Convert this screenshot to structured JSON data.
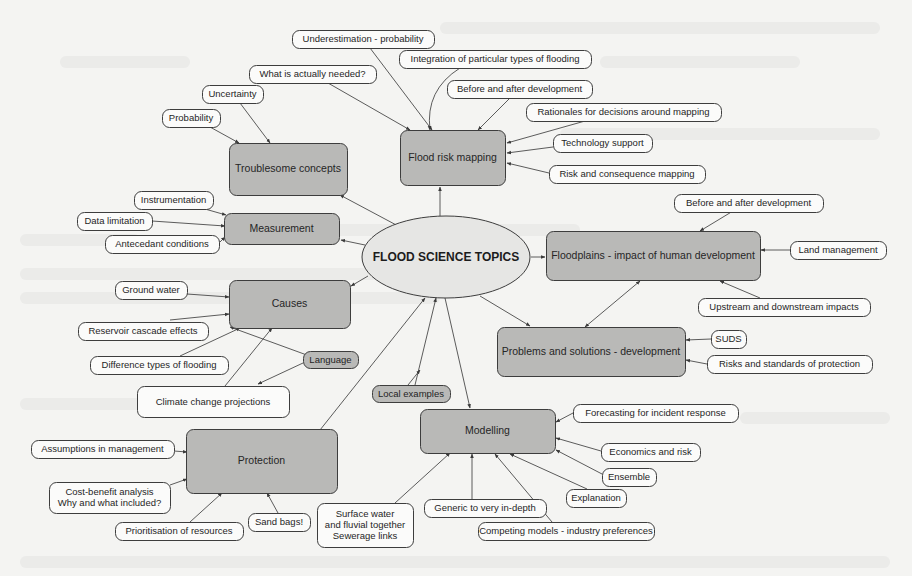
{
  "diagram": {
    "title": "FLOOD SCIENCE TOPICS",
    "colors": {
      "background": "#f4f4f2",
      "main_node_fill": "#b9b9b7",
      "leaf_node_fill": "#fbfbfa",
      "center_fill": "#e6e6e4",
      "stroke": "#3d3d3d"
    },
    "center": {
      "id": "center",
      "label": "FLOOD SCIENCE TOPICS",
      "cx": 446,
      "cy": 257,
      "rx": 84,
      "ry": 41
    },
    "main_nodes": [
      {
        "id": "troublesome",
        "label": "Troublesome concepts",
        "x": 229,
        "y": 143,
        "w": 118,
        "h": 52
      },
      {
        "id": "measurement",
        "label": "Measurement",
        "x": 224,
        "y": 213,
        "w": 115,
        "h": 31
      },
      {
        "id": "causes",
        "label": "Causes",
        "x": 229,
        "y": 280,
        "w": 121,
        "h": 48
      },
      {
        "id": "protection",
        "label": "Protection",
        "x": 186,
        "y": 429,
        "w": 151,
        "h": 64
      },
      {
        "id": "modelling",
        "label": "Modelling",
        "x": 420,
        "y": 409,
        "w": 135,
        "h": 44
      },
      {
        "id": "problems",
        "label": "Problems and solutions - development",
        "x": 497,
        "y": 327,
        "w": 188,
        "h": 49
      },
      {
        "id": "floodplains",
        "label": "Floodplains - impact of human development",
        "x": 546,
        "y": 231,
        "w": 214,
        "h": 49
      },
      {
        "id": "mapping",
        "label": "Flood risk mapping",
        "x": 400,
        "y": 130,
        "w": 105,
        "h": 55
      }
    ],
    "tag_nodes": [
      {
        "id": "language",
        "label": "Language",
        "x": 303,
        "y": 351,
        "w": 55,
        "h": 17
      },
      {
        "id": "local",
        "label": "Local examples",
        "x": 372,
        "y": 385,
        "w": 78,
        "h": 17
      }
    ],
    "leaf_nodes": [
      {
        "id": "underestimation",
        "label": "Underestimation  - probability",
        "x": 292,
        "y": 30,
        "w": 142,
        "h": 18
      },
      {
        "id": "integration",
        "label": "Integration of particular types of flooding",
        "x": 399,
        "y": 50,
        "w": 192,
        "h": 18
      },
      {
        "id": "whatneeded",
        "label": "What is actually needed?",
        "x": 249,
        "y": 65,
        "w": 127,
        "h": 18
      },
      {
        "id": "uncertainty",
        "label": "Uncertainty",
        "x": 202,
        "y": 85,
        "w": 61,
        "h": 18
      },
      {
        "id": "probability",
        "label": "Probability",
        "x": 162,
        "y": 109,
        "w": 58,
        "h": 18
      },
      {
        "id": "beforeafter1",
        "label": "Before and after development",
        "x": 447,
        "y": 80,
        "w": 145,
        "h": 18
      },
      {
        "id": "rationales",
        "label": "Rationales for decisions around mapping",
        "x": 526,
        "y": 103,
        "w": 195,
        "h": 18
      },
      {
        "id": "technology",
        "label": "Technology support",
        "x": 553,
        "y": 134,
        "w": 99,
        "h": 18
      },
      {
        "id": "riskconseq",
        "label": "Risk and consequence mapping",
        "x": 549,
        "y": 165,
        "w": 156,
        "h": 18
      },
      {
        "id": "instrumentation",
        "label": "Instrumentation",
        "x": 134,
        "y": 191,
        "w": 79,
        "h": 18
      },
      {
        "id": "datalimitation",
        "label": "Data limitation",
        "x": 77,
        "y": 212,
        "w": 75,
        "h": 18
      },
      {
        "id": "antecedent",
        "label": "Antecedant conditions",
        "x": 105,
        "y": 235,
        "w": 114,
        "h": 18
      },
      {
        "id": "groundwater",
        "label": "Ground water",
        "x": 115,
        "y": 281,
        "w": 72,
        "h": 18
      },
      {
        "id": "reservoir",
        "label": "Reservoir cascade effects",
        "x": 78,
        "y": 322,
        "w": 130,
        "h": 18
      },
      {
        "id": "difference",
        "label": "Difference types of flooding",
        "x": 90,
        "y": 356,
        "w": 138,
        "h": 18
      },
      {
        "id": "climate",
        "label": "Climate change projections",
        "x": 137,
        "y": 386,
        "w": 152,
        "h": 31
      },
      {
        "id": "assumptions",
        "label": "Assumptions in management",
        "x": 31,
        "y": 440,
        "w": 143,
        "h": 18
      },
      {
        "id": "costbenefit",
        "label": "Cost-benefit analysis|Why and what included?",
        "x": 49,
        "y": 482,
        "w": 121,
        "h": 31
      },
      {
        "id": "prioritisation",
        "label": "Prioritisation of resources",
        "x": 115,
        "y": 522,
        "w": 128,
        "h": 18
      },
      {
        "id": "sandbags",
        "label": "Sand bags!",
        "x": 248,
        "y": 513,
        "w": 62,
        "h": 18
      },
      {
        "id": "surfacewater",
        "label": "Surface water|and fluvial together|Sewerage links",
        "x": 317,
        "y": 503,
        "w": 96,
        "h": 44
      },
      {
        "id": "generic",
        "label": "Generic to very in-depth",
        "x": 424,
        "y": 499,
        "w": 122,
        "h": 18
      },
      {
        "id": "competing",
        "label": "Competing models  - industry preferences",
        "x": 478,
        "y": 522,
        "w": 176,
        "h": 18
      },
      {
        "id": "explanation",
        "label": "Explanation",
        "x": 566,
        "y": 489,
        "w": 60,
        "h": 18
      },
      {
        "id": "ensemble",
        "label": "Ensemble",
        "x": 602,
        "y": 468,
        "w": 54,
        "h": 18
      },
      {
        "id": "economics",
        "label": "Economics and risk",
        "x": 601,
        "y": 443,
        "w": 99,
        "h": 18
      },
      {
        "id": "forecasting",
        "label": "Forecasting for incident response",
        "x": 573,
        "y": 404,
        "w": 165,
        "h": 18
      },
      {
        "id": "beforeafter2",
        "label": "Before and after development",
        "x": 674,
        "y": 194,
        "w": 149,
        "h": 18
      },
      {
        "id": "landmanagement",
        "label": "Land management",
        "x": 790,
        "y": 241,
        "w": 96,
        "h": 18
      },
      {
        "id": "upstream",
        "label": "Upstream and downstream impacts",
        "x": 698,
        "y": 298,
        "w": 172,
        "h": 18
      },
      {
        "id": "suds",
        "label": "SUDS",
        "x": 711,
        "y": 330,
        "w": 35,
        "h": 18
      },
      {
        "id": "risksstandards",
        "label": "Risks and standards of protection",
        "x": 707,
        "y": 355,
        "w": 165,
        "h": 18
      }
    ],
    "edges": [
      {
        "from": [
          400,
          227
        ],
        "to": [
          340,
          195
        ]
      },
      {
        "from": [
          365,
          245
        ],
        "to": [
          341,
          240
        ]
      },
      {
        "from": [
          368,
          276
        ],
        "to": [
          351,
          286
        ]
      },
      {
        "from": [
          440,
          216
        ],
        "to": [
          440,
          187
        ]
      },
      {
        "from": [
          531,
          257
        ],
        "to": [
          545,
          257
        ]
      },
      {
        "from": [
          480,
          296
        ],
        "to": [
          530,
          326
        ]
      },
      {
        "from": [
          445,
          298
        ],
        "to": [
          470,
          408
        ]
      },
      {
        "from": [
          320,
          430
        ],
        "to": [
          425,
          298
        ]
      },
      {
        "from": [
          415,
          385
        ],
        "to": [
          436,
          298
        ]
      },
      {
        "from": [
          315,
          358
        ],
        "to": [
          230,
          327
        ]
      },
      {
        "from": [
          210,
          127
        ],
        "to": [
          239,
          143
        ]
      },
      {
        "from": [
          240,
          103
        ],
        "to": [
          270,
          143
        ]
      },
      {
        "from": [
          328,
          83
        ],
        "to": [
          410,
          130
        ]
      },
      {
        "from": [
          370,
          48
        ],
        "to": [
          432,
          130
        ]
      },
      {
        "from": [
          460,
          68
        ],
        "to": [
          430,
          130
        ],
        "curve": [
          425,
          90
        ]
      },
      {
        "from": [
          510,
          98
        ],
        "to": [
          478,
          130
        ]
      },
      {
        "from": [
          585,
          121
        ],
        "to": [
          507,
          143
        ]
      },
      {
        "from": [
          553,
          147
        ],
        "to": [
          507,
          153
        ]
      },
      {
        "from": [
          549,
          173
        ],
        "to": [
          507,
          163
        ]
      },
      {
        "from": [
          205,
          209
        ],
        "to": [
          226,
          215
        ]
      },
      {
        "from": [
          152,
          221
        ],
        "to": [
          225,
          226
        ]
      },
      {
        "from": [
          219,
          243
        ],
        "to": [
          225,
          237
        ]
      },
      {
        "from": [
          187,
          294
        ],
        "to": [
          229,
          297
        ]
      },
      {
        "from": [
          170,
          320
        ],
        "to": [
          229,
          314
        ]
      },
      {
        "from": [
          180,
          356
        ],
        "to": [
          240,
          328
        ]
      },
      {
        "from": [
          225,
          386
        ],
        "to": [
          272,
          328
        ]
      },
      {
        "from": [
          303,
          363
        ],
        "to": [
          258,
          384
        ]
      },
      {
        "from": [
          174,
          451
        ],
        "to": [
          187,
          452
        ]
      },
      {
        "from": [
          170,
          485
        ],
        "to": [
          187,
          479
        ]
      },
      {
        "from": [
          190,
          522
        ],
        "to": [
          222,
          493
        ]
      },
      {
        "from": [
          278,
          513
        ],
        "to": [
          267,
          493
        ]
      },
      {
        "from": [
          395,
          503
        ],
        "to": [
          450,
          453
        ]
      },
      {
        "from": [
          472,
          499
        ],
        "to": [
          472,
          454
        ]
      },
      {
        "from": [
          552,
          522
        ],
        "to": [
          495,
          454
        ]
      },
      {
        "from": [
          587,
          489
        ],
        "to": [
          510,
          454
        ]
      },
      {
        "from": [
          602,
          474
        ],
        "to": [
          556,
          450
        ]
      },
      {
        "from": [
          601,
          451
        ],
        "to": [
          556,
          438
        ]
      },
      {
        "from": [
          573,
          413
        ],
        "to": [
          556,
          422
        ]
      },
      {
        "from": [
          408,
          385
        ],
        "to": [
          420,
          370
        ]
      },
      {
        "from": [
          733,
          211
        ],
        "to": [
          700,
          231
        ]
      },
      {
        "from": [
          790,
          250
        ],
        "to": [
          761,
          250
        ]
      },
      {
        "from": [
          760,
          298
        ],
        "to": [
          720,
          281
        ]
      },
      {
        "from": [
          711,
          339
        ],
        "to": [
          686,
          340
        ]
      },
      {
        "from": [
          707,
          364
        ],
        "to": [
          686,
          360
        ]
      },
      {
        "from": [
          640,
          281
        ],
        "to": [
          585,
          327
        ],
        "both": true
      }
    ]
  }
}
